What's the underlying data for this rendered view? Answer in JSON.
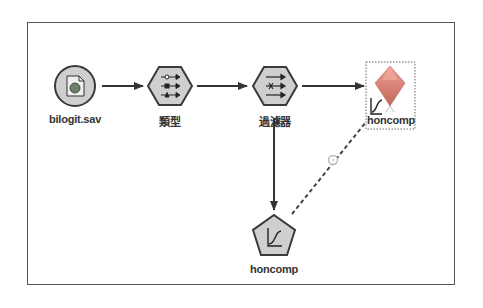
{
  "canvas": {
    "border_color": "#555555",
    "background": "#ffffff"
  },
  "nodes": [
    {
      "id": "source",
      "label": "bilogit.sav",
      "shape": "circle",
      "icon": "spss-file-icon"
    },
    {
      "id": "type",
      "label": "類型",
      "shape": "hexagon",
      "icon": "type-fields-icon"
    },
    {
      "id": "filter",
      "label": "過濾器",
      "shape": "hexagon",
      "icon": "filter-fields-icon"
    },
    {
      "id": "model-nugget",
      "label": "honcomp",
      "shape": "diamond-nugget",
      "icon": "logistic-curve-icon",
      "selected": true
    },
    {
      "id": "modeler",
      "label": "honcomp",
      "shape": "pentagon",
      "icon": "logistic-curve-icon"
    }
  ],
  "links": [
    {
      "from": "source",
      "to": "type",
      "style": "solid"
    },
    {
      "from": "type",
      "to": "filter",
      "style": "solid"
    },
    {
      "from": "filter",
      "to": "model-nugget",
      "style": "solid"
    },
    {
      "from": "filter",
      "to": "modeler",
      "style": "solid"
    },
    {
      "from": "modeler",
      "to": "model-nugget",
      "style": "dashed",
      "marker": "refresh-link-icon"
    }
  ],
  "colors": {
    "node_fill": "#cfcfcf",
    "node_stroke": "#3a3a3a",
    "link": "#333333",
    "nugget_top": "#e8948a",
    "nugget_bottom": "#c86a60"
  }
}
